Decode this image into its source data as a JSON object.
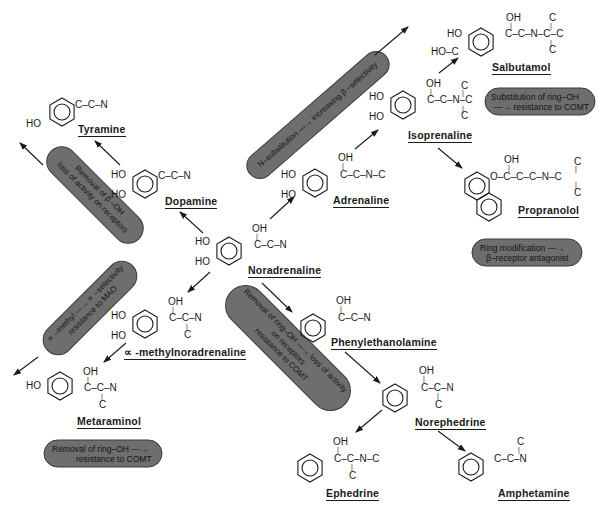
{
  "diagram": {
    "type": "structure-activity relationship chart of sympathomimetic amines",
    "compounds": [
      {
        "id": "noradrenaline",
        "name": "Noradrenaline",
        "ring_subs": [
          "HO",
          "HO"
        ],
        "chain": "C-C-N",
        "chain_sub_top": "OH"
      },
      {
        "id": "dopamine",
        "name": "Dopamine",
        "ring_subs": [
          "HO",
          "HO"
        ],
        "chain": "C-C-N"
      },
      {
        "id": "tyramine",
        "name": "Tyramine",
        "ring_subs": [
          "HO"
        ],
        "chain": "C-C-N"
      },
      {
        "id": "adrenaline",
        "name": "Adrenaline",
        "ring_subs": [
          "HO",
          "HO"
        ],
        "chain": "C-C-N-C",
        "chain_sub_top": "OH"
      },
      {
        "id": "isoprenaline",
        "name": "Isoprenaline",
        "ring_subs": [
          "HO",
          "HO"
        ],
        "chain": "C-C-N-C",
        "chain_sub_top": "OH",
        "n_branch_top": "C",
        "n_branch_bottom": "C"
      },
      {
        "id": "salbutamol",
        "name": "Salbutamol",
        "ring_subs": [
          "HO",
          "HO-C"
        ],
        "chain": "C-C-N-C-C",
        "chain_sub_top": "OH",
        "n_branch_top": "C",
        "n_branch_bottom": "C"
      },
      {
        "id": "propranolol",
        "name": "Propranolol",
        "ring_subs": [],
        "chain": "O-C-C-C-N-C",
        "chain_sub_top": "OH",
        "n_branch_top": "C",
        "n_branch_bottom": "C"
      },
      {
        "id": "phenylethanolamine",
        "name": "Phenylethanolamine",
        "ring_subs": [],
        "chain": "C-C-N",
        "chain_sub_top": "OH"
      },
      {
        "id": "norephedrine",
        "name": "Norephedrine",
        "ring_subs": [],
        "chain": "C-C-N",
        "chain_sub_top": "OH",
        "chain_sub_bottom": "C"
      },
      {
        "id": "ephedrine",
        "name": "Ephedrine",
        "ring_subs": [],
        "chain": "C-C-N-C",
        "chain_sub_top": "OH",
        "chain_sub_bottom": "C"
      },
      {
        "id": "amphetamine",
        "name": "Amphetamine",
        "ring_subs": [],
        "chain": "C-C-N",
        "chain_sub_top": "C"
      },
      {
        "id": "alpha_methylnoradrenaline",
        "name": "∝ -methylnoradrenaline",
        "ring_subs": [
          "HO",
          "HO"
        ],
        "chain": "C-C-N",
        "chain_sub_top": "OH",
        "chain_sub_bottom": "C"
      },
      {
        "id": "metaraminol",
        "name": "Metaraminol",
        "ring_subs": [
          "HO"
        ],
        "chain": "C-C-N",
        "chain_sub_top": "OH",
        "chain_sub_bottom": "C"
      }
    ],
    "atoms": {
      "HO": "HO",
      "OH": "OH",
      "C": "C",
      "HOC": "HO–C",
      "CCN": "C–C–N",
      "CCNC": "C–C–N–C",
      "CCNCC": "C–C–N–C–C",
      "CCNCbranch": "C–C–N–C",
      "OCCCNC": "O–C–C–C–N–C",
      "bar": "|"
    },
    "pills": {
      "beta_oh": {
        "line1": "Removal of β –OH",
        "line2": "loss of activity on receptors"
      },
      "n_subst": {
        "line1": "N–substitution —→ increasing β –selectivity"
      },
      "sub_ring_oh": {
        "line1": "Substitution of ring–OH",
        "line2": "—→ resistance to COMT"
      },
      "ring_mod": {
        "line1": "Ring modification —→",
        "line2": "β–receptor antagonist"
      },
      "alpha_methyl": {
        "line1": "∝ –methyl —→ ∝ –selectivity",
        "line2": "resistance to MAO"
      },
      "removal_ring_oh_center": {
        "line1": "Removal of ring–OH —→ loss of activity",
        "line2": "on receptors",
        "line3": "resistance to COMT"
      },
      "removal_ring_oh_bottom": {
        "line1": "Removal of ring–OH —→",
        "line2": "resistance to COMT"
      }
    },
    "colors": {
      "pill_fill": "#6e6e6e",
      "pill_border": "#3a3a3a",
      "ink": "#1a1a1a",
      "background": "#ffffff"
    }
  }
}
